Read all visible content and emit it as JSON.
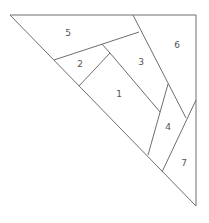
{
  "diagram": {
    "regions": [
      {
        "id": "1",
        "label": "1",
        "x": 119,
        "y": 94
      },
      {
        "id": "2",
        "label": "2",
        "x": 80,
        "y": 64
      },
      {
        "id": "3",
        "label": "3",
        "x": 141,
        "y": 62
      },
      {
        "id": "4",
        "label": "4",
        "x": 168,
        "y": 127
      },
      {
        "id": "5",
        "label": "5",
        "x": 68,
        "y": 33
      },
      {
        "id": "6",
        "label": "6",
        "x": 177,
        "y": 45
      },
      {
        "id": "7",
        "label": "7",
        "x": 184,
        "y": 163
      }
    ],
    "stroke_color": "#6e6e6e"
  }
}
